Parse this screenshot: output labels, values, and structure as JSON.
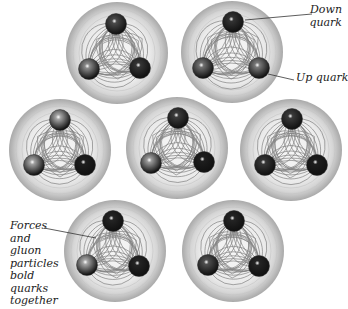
{
  "figure": {
    "background": "#ffffff",
    "sphere_fill_outer": "#b8b8b8",
    "sphere_fill_inner": "#f4f4f4",
    "gluon_line_color": "#6e6e6e",
    "quark_radius": 10.5,
    "sphere_radius": 51
  },
  "particles": [
    {
      "cx": 117,
      "cy": 53,
      "quarks": [
        {
          "x": 116,
          "y": 24,
          "shade": "#4a4a4a"
        },
        {
          "x": 89,
          "y": 69,
          "shade": "#8a8a8a"
        },
        {
          "x": 140,
          "y": 68,
          "shade": "#353535"
        }
      ]
    },
    {
      "cx": 232,
      "cy": 52,
      "quarks": [
        {
          "x": 233,
          "y": 22,
          "shade": "#333333"
        },
        {
          "x": 203,
          "y": 68,
          "shade": "#707070"
        },
        {
          "x": 259,
          "y": 68,
          "shade": "#7a7a7a"
        }
      ]
    },
    {
      "cx": 60,
      "cy": 150,
      "quarks": [
        {
          "x": 60,
          "y": 120,
          "shade": "#a5a5a5"
        },
        {
          "x": 34,
          "y": 165,
          "shade": "#a0a0a0"
        },
        {
          "x": 85,
          "y": 165,
          "shade": "#1e1e1e"
        }
      ]
    },
    {
      "cx": 177,
      "cy": 148,
      "quarks": [
        {
          "x": 178,
          "y": 118,
          "shade": "#3c3c3c"
        },
        {
          "x": 151,
          "y": 163,
          "shade": "#9a9a9a"
        },
        {
          "x": 204,
          "y": 162,
          "shade": "#1e1e1e"
        }
      ]
    },
    {
      "cx": 291,
      "cy": 150,
      "quarks": [
        {
          "x": 292,
          "y": 119,
          "shade": "#3a3a3a"
        },
        {
          "x": 265,
          "y": 165,
          "shade": "#363636"
        },
        {
          "x": 317,
          "y": 165,
          "shade": "#1e1e1e"
        }
      ]
    },
    {
      "cx": 115,
      "cy": 251,
      "quarks": [
        {
          "x": 113,
          "y": 221,
          "shade": "#242424"
        },
        {
          "x": 87,
          "y": 265,
          "shade": "#a5a5a5"
        },
        {
          "x": 139,
          "y": 266,
          "shade": "#242424"
        }
      ]
    },
    {
      "cx": 233,
      "cy": 251,
      "quarks": [
        {
          "x": 234,
          "y": 221,
          "shade": "#242424"
        },
        {
          "x": 208,
          "y": 265,
          "shade": "#4e4e4e"
        },
        {
          "x": 259,
          "y": 266,
          "shade": "#242424"
        }
      ]
    }
  ],
  "annotations": {
    "down_quark": {
      "line1": "Down",
      "line2": "quark",
      "pointer": {
        "x1": 245,
        "y1": 20,
        "x2": 312,
        "y2": 14
      }
    },
    "up_quark": {
      "text": "Up quark",
      "pointer": {
        "x1": 268,
        "y1": 74,
        "x2": 294,
        "y2": 80
      }
    },
    "forces": {
      "lines": [
        "Forces",
        "and",
        "gluon",
        "particles",
        "bold",
        "quarks",
        "together"
      ],
      "pointer": {
        "x1": 44,
        "y1": 228,
        "x2": 96,
        "y2": 238
      }
    }
  }
}
